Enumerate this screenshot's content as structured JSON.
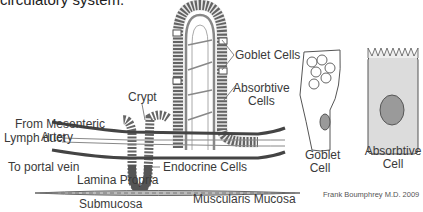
{
  "title": "circulatory system.",
  "labels": {
    "from_mesenteric_artery_1": "From Mesenteric",
    "from_mesenteric_artery_2": "Artery",
    "crypt": "Crypt",
    "lymph_duct": "Lymph duct",
    "to_portal_vein": "To portal vein",
    "lamina_propria": "Lamina Propria",
    "submucosa": "Submucosa",
    "muscularis_mucosa": "Muscularis Mucosa",
    "endocrine_cells": "Endocrine Cells",
    "goblet_cells": "Goblet Cells",
    "absorbtive_cells_1": "Absorbtive",
    "absorbtive_cells_2": "Cells",
    "goblet_cell_1": "Goblet",
    "goblet_cell_2": "Cell",
    "absorbtive_cell_1": "Absorbtive",
    "absorbtive_cell_2": "Cell"
  },
  "credit": "Frank Boumphrey M.D. 2009",
  "colors": {
    "outline": "#555555",
    "cell_fill": "#dcdcdc",
    "nucleus": "#9a9a9a",
    "vessel": "#444444"
  }
}
